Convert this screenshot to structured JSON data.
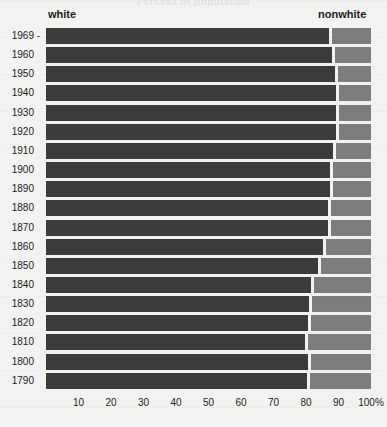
{
  "chart_title": "Percent of population",
  "legend": {
    "left_label": "white",
    "right_label": "nonwhite",
    "white_color": "#3b3b3b",
    "nonwhite_color": "#7d7d7d"
  },
  "axis": {
    "x_tick_labels": [
      "10",
      "20",
      "30",
      "40",
      "50",
      "60",
      "70",
      "80",
      "90",
      "100%"
    ],
    "x_tick_values": [
      10,
      20,
      30,
      40,
      50,
      60,
      70,
      80,
      90,
      100
    ]
  },
  "chart_data": {
    "type": "bar",
    "orientation": "horizontal",
    "stacked": true,
    "title": "Percent of population",
    "xlabel": "",
    "ylabel": "",
    "xlim": [
      0,
      100
    ],
    "grid": false,
    "legend_position": "top",
    "categories": [
      "1969",
      "1960",
      "1950",
      "1940",
      "1930",
      "1920",
      "1910",
      "1900",
      "1890",
      "1880",
      "1870",
      "1860",
      "1850",
      "1840",
      "1830",
      "1820",
      "1810",
      "1800",
      "1790"
    ],
    "series": [
      {
        "name": "white",
        "color": "#3b3b3b",
        "values": [
          87.5,
          88.6,
          89.5,
          89.8,
          89.8,
          89.7,
          88.9,
          87.9,
          87.8,
          87.1,
          87.1,
          85.6,
          84.3,
          81.9,
          81.4,
          81.1,
          80.3,
          81.1,
          80.7
        ]
      },
      {
        "name": "nonwhite",
        "color": "#7d7d7d",
        "values": [
          12.5,
          11.4,
          10.5,
          10.2,
          10.2,
          10.3,
          11.1,
          12.1,
          12.2,
          12.9,
          12.9,
          14.4,
          15.7,
          18.1,
          18.6,
          18.9,
          19.7,
          18.9,
          19.3
        ]
      }
    ],
    "x_ticks": [
      10,
      20,
      30,
      40,
      50,
      60,
      70,
      80,
      90,
      100
    ],
    "x_tick_labels": [
      "10",
      "20",
      "30",
      "40",
      "50",
      "60",
      "70",
      "80",
      "90",
      "100%"
    ]
  }
}
